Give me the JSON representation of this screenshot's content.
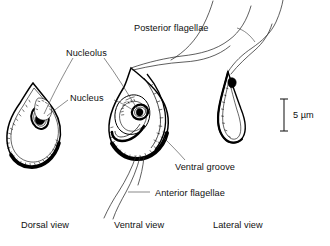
{
  "figure": {
    "background_color": "#ffffff",
    "ink_color": "#000000",
    "leader_color": "#3a3a3a"
  },
  "labels": {
    "posterior_flagellae": "Posterior flagellae",
    "nucleolus": "Nucleolus",
    "nucleus": "Nucleus",
    "ventral_groove": "Ventral groove",
    "anterior_flagellae": "Anterior flagellae"
  },
  "captions": {
    "dorsal": "Dorsal view",
    "ventral": "Ventral view",
    "lateral": "Lateral view"
  },
  "scale_bar": {
    "label": "5 µm",
    "value": 5,
    "unit": "µm",
    "orientation": "vertical"
  },
  "views": [
    {
      "name": "dorsal-view",
      "caption": "Dorsal view",
      "shape": "teardrop",
      "organelles": [
        "nucleus",
        "nucleolus"
      ]
    },
    {
      "name": "ventral-view",
      "caption": "Ventral view",
      "shape": "teardrop-with-groove",
      "organelles": [
        "nucleus",
        "nucleolus",
        "ventral groove",
        "anterior flagellae",
        "posterior flagellae"
      ]
    },
    {
      "name": "lateral-view",
      "caption": "Lateral view",
      "shape": "narrow-curved",
      "organelles": [
        "posterior flagellae"
      ]
    }
  ]
}
